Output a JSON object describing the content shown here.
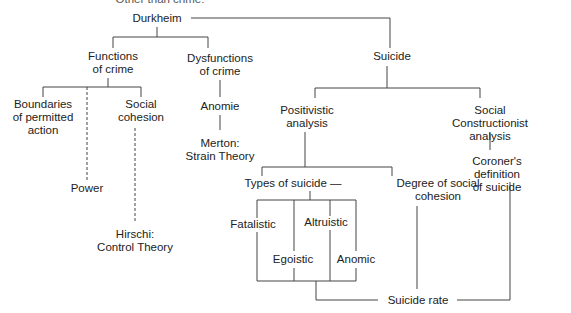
{
  "diagram": {
    "clipped_top_text": "Other than crime:",
    "root": "Durkheim",
    "nodes": {
      "functions_of_crime": "Functions\nof crime",
      "dysfunctions_of_crime": "Dysfunctions\nof crime",
      "suicide": "Suicide",
      "boundaries": "Boundaries\nof permitted\naction",
      "social_cohesion": "Social\ncohesion",
      "power": "Power",
      "hirschi": "Hirschi:\nControl Theory",
      "anomie": "Anomie",
      "merton": "Merton:\nStrain Theory",
      "positivistic": "Positivistic\nanalysis",
      "social_constructionist": "Social Constructionist\nanalysis",
      "coroners_definition": "Coroner's definition\nof suicide",
      "types_of_suicide": "Types of suicide —",
      "degree_of_social_cohesion": "Degree of social\ncohesion",
      "fatalistic": "Fatalistic",
      "altruistic": "Altruistic",
      "egoistic": "Egoistic",
      "anomic": "Anomic",
      "suicide_rate": "Suicide rate"
    },
    "edges": [
      [
        "Durkheim",
        "Functions of crime",
        "solid"
      ],
      [
        "Durkheim",
        "Dysfunctions of crime",
        "solid"
      ],
      [
        "Durkheim",
        "Suicide",
        "solid"
      ],
      [
        "Functions of crime",
        "Boundaries of permitted action",
        "solid"
      ],
      [
        "Functions of crime",
        "Social cohesion",
        "solid"
      ],
      [
        "Functions of crime",
        "Power",
        "dashed"
      ],
      [
        "Social cohesion",
        "Hirschi: Control Theory",
        "dashed"
      ],
      [
        "Dysfunctions of crime",
        "Anomie",
        "solid"
      ],
      [
        "Anomie",
        "Merton: Strain Theory",
        "solid"
      ],
      [
        "Suicide",
        "Positivistic analysis",
        "solid"
      ],
      [
        "Suicide",
        "Social Constructionist analysis",
        "solid"
      ],
      [
        "Positivistic analysis",
        "Types of suicide",
        "solid"
      ],
      [
        "Positivistic analysis",
        "Degree of social cohesion",
        "solid"
      ],
      [
        "Social Constructionist analysis",
        "Coroner's definition of suicide",
        "solid"
      ],
      [
        "Types of suicide",
        "Fatalistic",
        "solid"
      ],
      [
        "Types of suicide",
        "Altruistic",
        "solid"
      ],
      [
        "Types of suicide",
        "Egoistic",
        "solid"
      ],
      [
        "Types of suicide",
        "Anomic",
        "solid"
      ],
      [
        "Types of suicide",
        "Suicide rate",
        "solid"
      ],
      [
        "Degree of social cohesion",
        "Suicide rate",
        "solid"
      ],
      [
        "Coroner's definition of suicide",
        "Suicide rate",
        "solid"
      ]
    ]
  }
}
